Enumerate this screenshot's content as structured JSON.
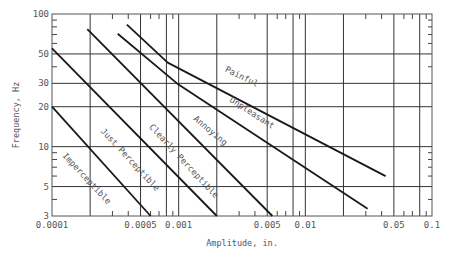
{
  "chart_data": {
    "type": "line",
    "title": "",
    "xlabel": "Amplitude, in.",
    "ylabel": "Frequency, Hz",
    "xscale": "log",
    "yscale": "log",
    "xlim": [
      0.0001,
      0.1
    ],
    "ylim": [
      3,
      100
    ],
    "grid": true,
    "legend": "none (inline curve labels)",
    "x_tick_labels": [
      "0.0001",
      "0.0005",
      "0.001",
      "0.005",
      "0.01",
      "0.05",
      "0.1"
    ],
    "x_ticks": [
      0.0001,
      0.0005,
      0.001,
      0.005,
      0.01,
      0.05,
      0.1
    ],
    "x_gridlines": [
      0.0002,
      0.0005,
      0.0008,
      0.001,
      0.002,
      0.005,
      0.008,
      0.01,
      0.02,
      0.05,
      0.08
    ],
    "y_tick_labels": [
      "100",
      "50",
      "30",
      "20",
      "10",
      "5",
      "3"
    ],
    "y_ticks": [
      100,
      50,
      30,
      20,
      10,
      5,
      3
    ],
    "y_gridlines": [
      50,
      30,
      20,
      10,
      5
    ],
    "series": [
      {
        "name": "Imperceptible / Just Perceptible boundary",
        "points": [
          [
            0.0001,
            20
          ],
          [
            0.0006,
            3
          ]
        ]
      },
      {
        "name": "Just Perceptible / Clearly Perceptible boundary",
        "points": [
          [
            0.0001,
            55
          ],
          [
            0.002,
            3
          ]
        ]
      },
      {
        "name": "Clearly Perceptible / Annoying boundary",
        "points": [
          [
            0.00019,
            77
          ],
          [
            0.0055,
            3
          ]
        ]
      },
      {
        "name": "Annoying / Unpleasant boundary",
        "points": [
          [
            0.00033,
            71
          ],
          [
            0.00097,
            30
          ],
          [
            0.031,
            3.4
          ]
        ]
      },
      {
        "name": "Unpleasant / Painful boundary",
        "points": [
          [
            0.00039,
            83
          ],
          [
            0.00082,
            43
          ],
          [
            0.043,
            6
          ]
        ]
      }
    ],
    "annotations": [
      {
        "text": "Imperceptible",
        "x": 0.00012,
        "y": 8.5,
        "angle": 47
      },
      {
        "text": "Just Perceptible",
        "x": 0.00024,
        "y": 13,
        "angle": 47
      },
      {
        "text": "Clearly Perceptible",
        "x": 0.00058,
        "y": 14,
        "angle": 47
      },
      {
        "text": "Annoying",
        "x": 0.0013,
        "y": 16,
        "angle": 40
      },
      {
        "text": "Unpleasant",
        "x": 0.0025,
        "y": 22,
        "angle": 33
      },
      {
        "text": "Painful",
        "x": 0.0023,
        "y": 37,
        "angle": 26
      }
    ]
  },
  "labels": {
    "xlabel": "Amplitude, in.",
    "ylabel": "Frequency, Hz",
    "curves": [
      "Imperceptible",
      "Just Perceptible",
      "Clearly Perceptible",
      "Annoying",
      "Unpleasant",
      "Painful"
    ]
  }
}
